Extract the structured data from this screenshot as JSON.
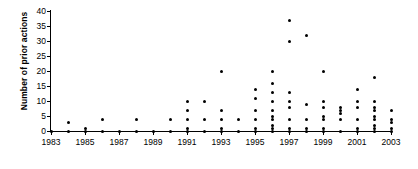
{
  "chart_data": {
    "type": "scatter",
    "title": "",
    "xlabel": "",
    "ylabel": "Number of prior actions",
    "xlim": [
      1983,
      2003
    ],
    "ylim": [
      0,
      40
    ],
    "ytick_step": 5,
    "xtick_step": 2,
    "grid": false,
    "legend": null,
    "xticks": [
      "1983",
      "1985",
      "1987",
      "1989",
      "1991",
      "1993",
      "1995",
      "1997",
      "1999",
      "2001",
      "2003"
    ],
    "yticks": [
      "0",
      "5",
      "10",
      "15",
      "20",
      "25",
      "30",
      "35",
      "40"
    ],
    "marker": "filled-circle",
    "marker_color": "#000000",
    "points": [
      [
        1983,
        0
      ],
      [
        1984,
        0
      ],
      [
        1984,
        3
      ],
      [
        1985,
        0
      ],
      [
        1985,
        1
      ],
      [
        1986,
        0
      ],
      [
        1986,
        4
      ],
      [
        1987,
        0
      ],
      [
        1988,
        0
      ],
      [
        1988,
        4
      ],
      [
        1989,
        0
      ],
      [
        1990,
        0
      ],
      [
        1990,
        4
      ],
      [
        1991,
        0
      ],
      [
        1991,
        1
      ],
      [
        1991,
        4
      ],
      [
        1991,
        7
      ],
      [
        1991,
        10
      ],
      [
        1992,
        0
      ],
      [
        1992,
        4
      ],
      [
        1992,
        10
      ],
      [
        1993,
        0
      ],
      [
        1993,
        1
      ],
      [
        1993,
        4
      ],
      [
        1993,
        7
      ],
      [
        1993,
        20
      ],
      [
        1994,
        0
      ],
      [
        1994,
        4
      ],
      [
        1995,
        0
      ],
      [
        1995,
        1
      ],
      [
        1995,
        4
      ],
      [
        1995,
        7
      ],
      [
        1995,
        11
      ],
      [
        1995,
        14
      ],
      [
        1996,
        0
      ],
      [
        1996,
        1
      ],
      [
        1996,
        2
      ],
      [
        1996,
        4
      ],
      [
        1996,
        5
      ],
      [
        1996,
        7
      ],
      [
        1996,
        10
      ],
      [
        1996,
        13
      ],
      [
        1996,
        16
      ],
      [
        1996,
        20
      ],
      [
        1997,
        0
      ],
      [
        1997,
        1
      ],
      [
        1997,
        4
      ],
      [
        1997,
        8
      ],
      [
        1997,
        10
      ],
      [
        1997,
        13
      ],
      [
        1997,
        30
      ],
      [
        1997,
        37
      ],
      [
        1998,
        0
      ],
      [
        1998,
        1
      ],
      [
        1998,
        4
      ],
      [
        1998,
        9
      ],
      [
        1998,
        32
      ],
      [
        1999,
        0
      ],
      [
        1999,
        1
      ],
      [
        1999,
        4
      ],
      [
        1999,
        5
      ],
      [
        1999,
        8
      ],
      [
        1999,
        10
      ],
      [
        1999,
        20
      ],
      [
        2000,
        0
      ],
      [
        2000,
        4
      ],
      [
        2000,
        6
      ],
      [
        2000,
        7
      ],
      [
        2000,
        8
      ],
      [
        2001,
        0
      ],
      [
        2001,
        1
      ],
      [
        2001,
        4
      ],
      [
        2001,
        8
      ],
      [
        2001,
        10
      ],
      [
        2001,
        14
      ],
      [
        2002,
        0
      ],
      [
        2002,
        1
      ],
      [
        2002,
        2
      ],
      [
        2002,
        4
      ],
      [
        2002,
        5
      ],
      [
        2002,
        7
      ],
      [
        2002,
        8
      ],
      [
        2002,
        10
      ],
      [
        2002,
        18
      ],
      [
        2003,
        0
      ],
      [
        2003,
        1
      ],
      [
        2003,
        3
      ],
      [
        2003,
        4
      ],
      [
        2003,
        7
      ]
    ]
  }
}
